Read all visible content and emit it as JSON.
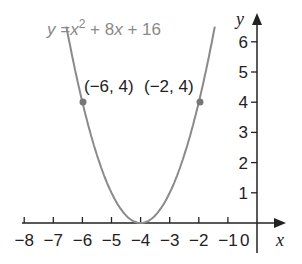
{
  "chart_data": {
    "type": "line",
    "title": "",
    "equation_label": "y = x² + 8x + 16",
    "equation_parts": {
      "y": "y",
      "eq": " =",
      "x": "x",
      "sup": "2",
      "rest": " + 8",
      "x2": "x",
      "end": " + 16"
    },
    "xlabel": "x",
    "ylabel": "y",
    "xlim": [
      -8,
      0
    ],
    "ylim": [
      0,
      6
    ],
    "x_ticks": [
      -8,
      -7,
      -6,
      -5,
      -4,
      -3,
      -2,
      -1
    ],
    "x_tick_labels": [
      "−8",
      "−7",
      "−6",
      "−5",
      "−4",
      "−3",
      "−2",
      "−1"
    ],
    "origin_label": "0",
    "y_ticks": [
      1,
      2,
      3,
      4,
      5,
      6
    ],
    "y_tick_labels": [
      "1",
      "2",
      "3",
      "4",
      "5",
      "6"
    ],
    "series": [
      {
        "name": "y = x^2 + 8x + 16",
        "color": "#8a8a8a",
        "x": [
          -6.5,
          -6,
          -5,
          -4,
          -3,
          -2,
          -1.5
        ],
        "y": [
          6.25,
          4,
          1,
          0,
          1,
          4,
          6.25
        ]
      }
    ],
    "annotations": [
      {
        "label": "(−6, 4)",
        "x": -6,
        "y": 4
      },
      {
        "label": "(−2, 4)",
        "x": -2,
        "y": 4
      }
    ],
    "grid": false,
    "legend": "none"
  }
}
